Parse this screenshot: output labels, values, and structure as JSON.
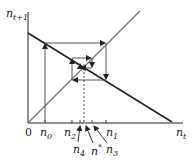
{
  "diagram": {
    "type": "cobweb",
    "y_axis_label": {
      "base": "n",
      "sub": "t+1"
    },
    "x_axis_label": {
      "base": "n",
      "sub": "t"
    },
    "origin_label": "0",
    "tick_labels": [
      {
        "base": "n",
        "sub": "0"
      },
      {
        "base": "n",
        "sub": "2"
      },
      {
        "base": "n",
        "sub": "1"
      },
      {
        "base": "n",
        "sub": "4"
      },
      {
        "base": "n",
        "sub": "*"
      },
      {
        "base": "n",
        "sub": "3"
      }
    ],
    "colors": {
      "axis": "#222222",
      "line": "#222222",
      "diagonal": "#777777",
      "cobweb": "#555555"
    }
  }
}
